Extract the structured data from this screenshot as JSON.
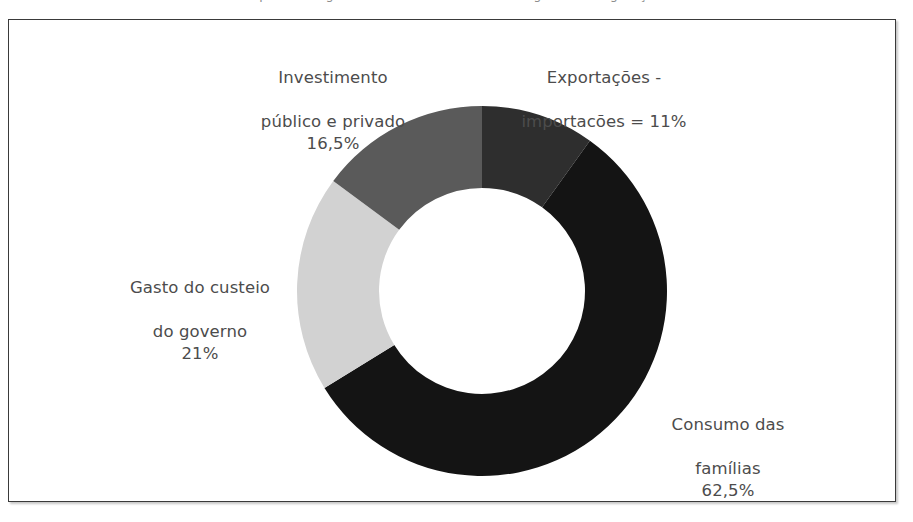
{
  "caption_sliver": "A partir dos gastos, o PIB brasileiro tem a seguinte configuração:",
  "frame": {
    "border_color": "#3a3a3a",
    "background_color": "#ffffff"
  },
  "labels": {
    "investimento": {
      "line1": "Investimento",
      "line2": "público e privado",
      "value": "16,5%"
    },
    "exportacoes": {
      "line1": "Exportações -",
      "line2": "importacões = 11%",
      "value": ""
    },
    "gasto": {
      "line1": "Gasto do custeio",
      "line2": "do governo",
      "value": "21%"
    },
    "consumo": {
      "line1": "Consumo das",
      "line2": "famílias",
      "value": "62,5%"
    }
  },
  "chart_data": {
    "type": "pie",
    "variant": "donut",
    "title": "",
    "xlabel": "",
    "ylabel": "",
    "units": "percent",
    "start_angle_deg": 0,
    "direction": "clockwise",
    "inner_radius_ratio": 0.556,
    "legend": "none",
    "grid": false,
    "labels_placement": "outside-callout",
    "categories": [
      "Exportações - importacões",
      "Consumo das famílias",
      "Gasto do custeio do governo",
      "Investimento público e privado"
    ],
    "values": [
      11,
      62.5,
      21,
      16.5
    ],
    "value_labels": [
      "11%",
      "62,5%",
      "21%",
      "16,5%"
    ],
    "colors": [
      "#2e2e2e",
      "#141414",
      "#d2d2d2",
      "#5a5a5a"
    ],
    "total": 111,
    "note": "Values as printed sum to 111%, not 100%."
  },
  "geometry": {
    "center_x": 193,
    "center_y": 193,
    "outer_radius": 185,
    "inner_radius": 103
  }
}
